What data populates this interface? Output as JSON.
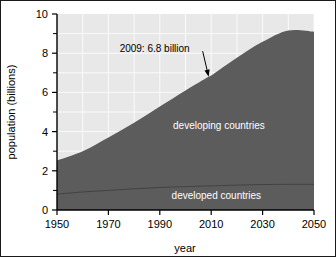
{
  "chart_data": {
    "type": "area",
    "title": "",
    "subtitle": "",
    "xlabel": "year",
    "ylabel": "population (billions)",
    "xlim": [
      1950,
      2050
    ],
    "ylim": [
      0,
      10
    ],
    "grid": true,
    "grid_x_step": 10,
    "grid_y_step": 1,
    "legend_position": "inline-on-area",
    "x_tick_labels": [
      "1950",
      "1970",
      "1990",
      "2010",
      "2030",
      "2050"
    ],
    "x_ticks": [
      1950,
      1970,
      1990,
      2010,
      2030,
      2050
    ],
    "y_tick_labels": [
      "0",
      "2",
      "4",
      "6",
      "8",
      "10"
    ],
    "y_ticks": [
      0,
      2,
      4,
      6,
      8,
      10
    ],
    "y_minor_ticks": [
      1,
      3,
      5,
      7,
      9
    ],
    "x": [
      1950,
      1960,
      1970,
      1980,
      1990,
      2000,
      2009,
      2010,
      2020,
      2030,
      2040,
      2050
    ],
    "series": [
      {
        "name": "developed countries",
        "values": [
          0.81,
          0.92,
          1.0,
          1.08,
          1.15,
          1.19,
          1.23,
          1.23,
          1.27,
          1.3,
          1.31,
          1.31
        ],
        "color": "#5c5c5c",
        "label_x": 2012,
        "label_y": 0.55
      },
      {
        "name": "developing countries",
        "values": [
          1.72,
          2.08,
          2.7,
          3.37,
          4.13,
          4.91,
          5.57,
          5.63,
          6.5,
          7.28,
          7.85,
          7.79
        ],
        "color": "#5c5c5c",
        "label_x": 2013,
        "label_y": 4.15
      }
    ],
    "total": {
      "name": "world population",
      "values": [
        2.53,
        3.0,
        3.7,
        4.45,
        5.28,
        6.1,
        6.8,
        6.86,
        7.77,
        8.58,
        9.16,
        9.1
      ]
    },
    "annotations": [
      {
        "text": "2009: 6.8 billion",
        "text_x": 1988,
        "text_y": 8.05,
        "point_x": 2009,
        "point_y": 6.8,
        "arrow": true
      }
    ],
    "colors": {
      "area_fill": "#5c5c5c",
      "plot_background": "#e8e8e8",
      "gridline": "#ffffff",
      "axis": "#000000",
      "figure_background": "#ffffff",
      "series_label_text": "#ffffff",
      "annotation_text": "#000000"
    }
  }
}
